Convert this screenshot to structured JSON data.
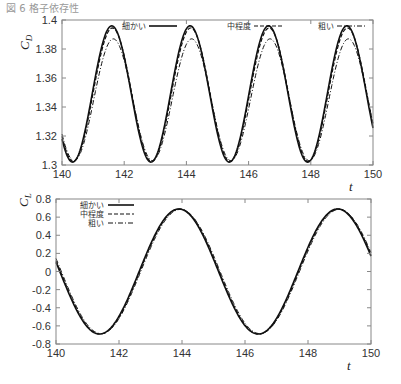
{
  "caption": "図 6  格子依存性",
  "chart_data": [
    {
      "type": "line",
      "title": "",
      "xlabel": "t",
      "ylabel": "C_D",
      "ylabel_main": "C",
      "ylabel_sub": "D",
      "xlim": [
        140,
        150
      ],
      "ylim": [
        1.3,
        1.4
      ],
      "xticks": [
        "140",
        "142",
        "144",
        "146",
        "148",
        "150"
      ],
      "yticks": [
        "1.3",
        "1.32",
        "1.34",
        "1.36",
        "1.38",
        "1.4"
      ],
      "legend_position": "top",
      "series": [
        {
          "name": "細かい",
          "style": "solid",
          "mean": 1.349,
          "amplitude": 0.047,
          "period": 2.52,
          "phase_peak": 141.6
        },
        {
          "name": "中程度",
          "style": "dashed",
          "mean": 1.3485,
          "amplitude": 0.046,
          "period": 2.52,
          "phase_peak": 141.62
        },
        {
          "name": "粗い",
          "style": "dashdot",
          "mean": 1.345,
          "amplitude": 0.042,
          "period": 2.52,
          "phase_peak": 141.65
        }
      ],
      "key_points": {
        "peaks_t": [
          141.6,
          144.1,
          146.65,
          149.15
        ],
        "peak_fine": 1.396,
        "peak_coarse": 1.388,
        "troughs_t": [
          140.35,
          142.9,
          145.4,
          147.9
        ],
        "trough_fine": 1.302,
        "trough_coarse": 1.305
      }
    },
    {
      "type": "line",
      "title": "",
      "xlabel": "t",
      "ylabel": "C_L",
      "ylabel_main": "C",
      "ylabel_sub": "L",
      "xlim": [
        140,
        150
      ],
      "ylim": [
        -0.8,
        0.8
      ],
      "xticks": [
        "140",
        "142",
        "144",
        "146",
        "148",
        "150"
      ],
      "yticks": [
        "-0.8",
        "-0.6",
        "-0.4",
        "-0.2",
        "0",
        "0.2",
        "0.4",
        "0.6",
        "0.8"
      ],
      "legend_position": "upper left",
      "series": [
        {
          "name": "細かい",
          "style": "solid",
          "amplitude": 0.69,
          "period": 5.04,
          "phase_peak": 143.9
        },
        {
          "name": "中程度",
          "style": "dashed",
          "amplitude": 0.69,
          "period": 5.04,
          "phase_peak": 143.92
        },
        {
          "name": "粗い",
          "style": "dashdot",
          "amplitude": 0.685,
          "period": 5.04,
          "phase_peak": 143.95
        }
      ],
      "key_points": {
        "start_value": 0.1,
        "min1": [
          141.35,
          -0.69
        ],
        "max1": [
          143.9,
          0.69
        ],
        "min2": [
          146.45,
          -0.69
        ],
        "max2": [
          148.95,
          0.69
        ],
        "end_value": 0.22
      }
    }
  ]
}
